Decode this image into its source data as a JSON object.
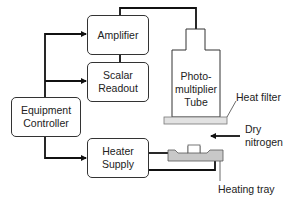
{
  "diagram": {
    "type": "block-diagram",
    "blocks": {
      "amplifier": "Amplifier",
      "scalar_readout_line1": "Scalar",
      "scalar_readout_line2": "Readout",
      "equipment_controller_line1": "Equipment",
      "equipment_controller_line2": "Controller",
      "heater_supply_line1": "Heater",
      "heater_supply_line2": "Supply"
    },
    "photomultiplier": {
      "line1": "Photo-",
      "line2": "multiplier",
      "line3": "Tube"
    },
    "labels": {
      "heat_filter": "Heat filter",
      "dry_nitrogen_line1": "Dry",
      "dry_nitrogen_line2": "nitrogen",
      "heating_tray": "Heating tray"
    },
    "connections": [
      {
        "from": "Equipment Controller",
        "to": "Amplifier",
        "arrow": true
      },
      {
        "from": "Equipment Controller",
        "to": "Scalar Readout",
        "arrow": true
      },
      {
        "from": "Equipment Controller",
        "to": "Heater Supply",
        "arrow": true
      },
      {
        "from": "Amplifier",
        "to": "Scalar Readout",
        "arrow": false
      },
      {
        "from": "Photomultiplier Tube",
        "to": "Amplifier",
        "arrow": false
      },
      {
        "from": "Heater Supply",
        "to": "Heating tray",
        "arrow": false
      },
      {
        "from": "Dry nitrogen",
        "to": "Heating tray",
        "arrow": true
      }
    ],
    "colors": {
      "line": "#111111",
      "box_border": "#333333",
      "filter_fill": "#e2e2e2",
      "tray_fill": "#c8c8c8"
    }
  }
}
